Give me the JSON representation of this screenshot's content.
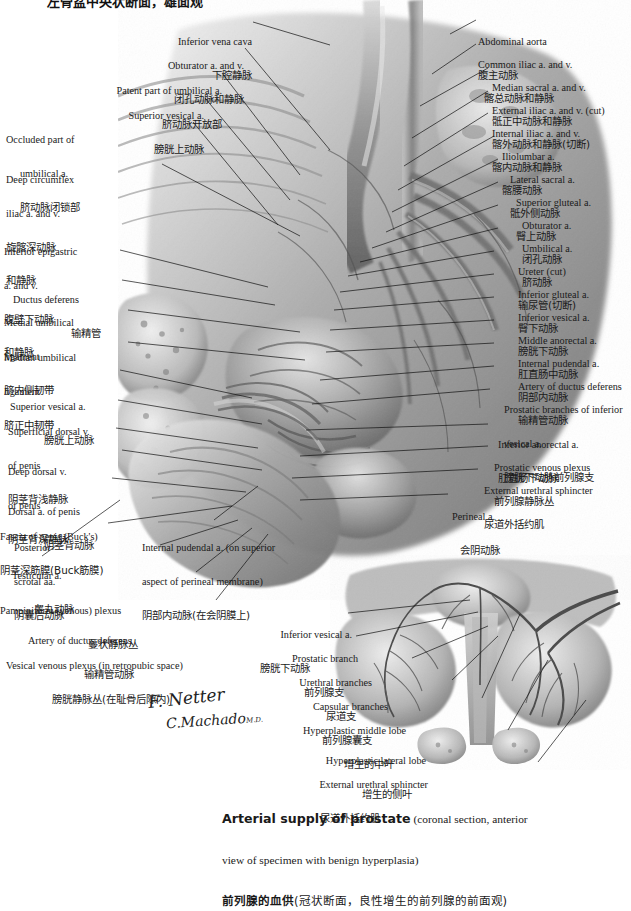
{
  "plate": {
    "top_title_clipped": "左骨盆中央状断面，雄面观",
    "caption": {
      "line1_bold": "Arterial supply of prostate",
      "line1_rest": " (coronal section, anterior",
      "line2": "view of specimen with benign hyperplasia)",
      "line3_bold_cn": "前列腺的血供",
      "line3_cn": "(冠状断面，良性增生的前列腺的前面观)"
    },
    "signatures": {
      "artist": "F. Netter",
      "coartist": "C.Machado",
      "credential": "M.D."
    },
    "colors": {
      "leader_line": "#111111",
      "text": "#1a1a1a",
      "background": "#ffffff",
      "artwork_tone": "#8c8c8c"
    }
  },
  "labels_left": [
    {
      "id": "inferior-epigastric",
      "en": [
        "Inferior epigastric",
        "a. and v."
      ],
      "cn": [
        "腹壁下动脉",
        "和静脉"
      ]
    },
    {
      "id": "ductus-deferens",
      "en": [
        "Ductus deferens"
      ],
      "cn": [
        "输精管"
      ]
    },
    {
      "id": "medial-umbilical-ligament",
      "en": [
        "Medial umbilical",
        "ligament"
      ],
      "cn": [
        "脐内侧韧带"
      ]
    },
    {
      "id": "median-umbilical-ligament",
      "en": [
        "Median umbilical",
        "ligament"
      ],
      "cn": [
        "脐正中韧带"
      ]
    },
    {
      "id": "superior-vesical-a-left",
      "en": [
        "Superior vesical a."
      ],
      "cn": [
        "膀胱上动脉"
      ]
    },
    {
      "id": "superficial-dorsal-v-penis",
      "en": [
        "Superficial dorsal v.",
        "of penis"
      ],
      "cn": [
        "阴茎背浅静脉"
      ]
    },
    {
      "id": "deep-dorsal-v-penis",
      "en": [
        "Deep dorsal v.",
        "of penis"
      ],
      "cn": [
        "阴茎背深静脉"
      ]
    },
    {
      "id": "dorsal-a-of-penis",
      "en": [
        "Dorsal a. of penis"
      ],
      "cn": [
        "阴茎背动脉"
      ]
    },
    {
      "id": "fascia-of-penis-bucks",
      "en": [
        "Fascia of penis (Buck's)"
      ],
      "cn": [
        "阴茎深筋膜(Buck筋膜)"
      ]
    },
    {
      "id": "testicular-a",
      "en": [
        "Testicular a."
      ],
      "cn": [
        "睾丸动脉"
      ]
    },
    {
      "id": "pampiniform-plexus",
      "en": [
        "Pampiniform (venous) plexus"
      ],
      "cn": [
        "蔓状静脉丛"
      ]
    },
    {
      "id": "artery-of-ductus-deferens-left",
      "en": [
        "Artery of ductus deferens"
      ],
      "cn": [
        "输精管动脉"
      ]
    },
    {
      "id": "vesical-venous-plexus",
      "en": [
        "Vesical venous plexus (in retropubic space)"
      ],
      "cn": [
        "膀胱静脉丛(在耻骨后隙内)"
      ]
    }
  ],
  "labels_upper_left": [
    {
      "id": "obturator-a-and-v",
      "en": [
        "Obturator a. and v."
      ],
      "cn": [
        "闭孔动脉和静脉"
      ]
    },
    {
      "id": "patent-part-umbilical-a",
      "en": [
        "Patent part of umbilical a."
      ],
      "cn": [
        "脐动脉开放部"
      ]
    },
    {
      "id": "superior-vesical-a-upper",
      "en": [
        "Superior vesical a."
      ],
      "cn": [
        "膀胱上动脉"
      ]
    },
    {
      "id": "occluded-part-umbilical-a",
      "en": [
        "Occluded part of",
        "umbilical a."
      ],
      "cn": [
        "脐动脉闭锁部"
      ]
    },
    {
      "id": "deep-circumflex-iliac",
      "en": [
        "Deep circumflex",
        "iliac a. and v."
      ],
      "cn": [
        "旋髂深动脉",
        "和静脉"
      ]
    }
  ],
  "labels_top_center": [
    {
      "id": "inferior-vena-cava",
      "en": [
        "Inferior vena cava"
      ],
      "cn": [
        "下腔静脉"
      ]
    }
  ],
  "labels_right": [
    {
      "id": "abdominal-aorta",
      "en": [
        "Abdominal aorta"
      ],
      "cn": [
        "腹主动脉"
      ]
    },
    {
      "id": "common-iliac",
      "en": [
        "Common iliac a. and v."
      ],
      "cn": [
        "髂总动脉和静脉"
      ]
    },
    {
      "id": "median-sacral",
      "en": [
        "Median sacral a. and v."
      ],
      "cn": [
        "骶正中动脉和静脉"
      ]
    },
    {
      "id": "external-iliac",
      "en": [
        "External iliac a. and v. (cut)"
      ],
      "cn": [
        "髂外动脉和静脉(切断)"
      ],
      "italic_tail": "cut"
    },
    {
      "id": "internal-iliac",
      "en": [
        "Internal iliac a. and v."
      ],
      "cn": [
        "髂内动脉和静脉"
      ]
    },
    {
      "id": "iliolumbar-a",
      "en": [
        "Iliolumbar a."
      ],
      "cn": [
        "髂腰动脉"
      ]
    },
    {
      "id": "lateral-sacral-a",
      "en": [
        "Lateral sacral a."
      ],
      "cn": [
        "骶外侧动脉"
      ]
    },
    {
      "id": "superior-gluteal-a",
      "en": [
        "Superior gluteal a."
      ],
      "cn": [
        "臀上动脉"
      ]
    },
    {
      "id": "obturator-a",
      "en": [
        "Obturator a."
      ],
      "cn": [
        "闭孔动脉"
      ]
    },
    {
      "id": "umbilical-a",
      "en": [
        "Umbilical a."
      ],
      "cn": [
        "脐动脉"
      ]
    },
    {
      "id": "ureter-cut",
      "en": [
        "Ureter (cut)"
      ],
      "cn": [
        "输尿管(切断)"
      ],
      "italic_tail": "cut"
    },
    {
      "id": "inferior-gluteal-a",
      "en": [
        "Inferior gluteal a."
      ],
      "cn": [
        "臀下动脉"
      ]
    },
    {
      "id": "inferior-vesical-a",
      "en": [
        "Inferior vesical a."
      ],
      "cn": [
        "膀胱下动脉"
      ]
    },
    {
      "id": "middle-anorectal-a",
      "en": [
        "Middle anorectal a."
      ],
      "cn": [
        "肛直肠中动脉"
      ]
    },
    {
      "id": "internal-pudendal-a",
      "en": [
        "Internal pudendal a."
      ],
      "cn": [
        "阴部内动脉"
      ]
    },
    {
      "id": "artery-of-ductus-deferens-right",
      "en": [
        "Artery of ductus deferens"
      ],
      "cn": [
        "输精管动脉"
      ]
    },
    {
      "id": "prostatic-branches-inferior-vesical",
      "en": [
        "Prostatic branches of inferior",
        "vesical a."
      ],
      "cn": [
        "膀胱下动脉前列腺支"
      ]
    },
    {
      "id": "inferior-anorectal-a",
      "en": [
        "Inferior anorectal a."
      ],
      "cn": [
        "肛直肠下动脉"
      ]
    },
    {
      "id": "prostatic-venous-plexus",
      "en": [
        "Prostatic venous plexus"
      ],
      "cn": [
        "前列腺静脉丛"
      ]
    },
    {
      "id": "external-urethral-sphincter-main",
      "en": [
        "External urethral sphincter"
      ],
      "cn": [
        "尿道外括约肌"
      ]
    },
    {
      "id": "perineal-a",
      "en": [
        "Perineal a."
      ],
      "cn": [
        "会阴动脉"
      ]
    }
  ],
  "labels_bottom_center": [
    {
      "id": "posterior-scrotal-aa",
      "en": [
        "Posterior",
        "scrotal aa."
      ],
      "cn": [
        "阴囊后动脉"
      ]
    },
    {
      "id": "internal-pudendal-a-perineal",
      "en": [
        "Internal pudendal a. (on superior",
        "aspect of perineal membrane)"
      ],
      "cn": [
        "阴部内动脉(在会阴膜上)"
      ]
    }
  ],
  "labels_inset": [
    {
      "id": "inset-inferior-vesical-a",
      "en": [
        "Inferior vesical a."
      ],
      "cn": [
        "膀胱下动脉"
      ]
    },
    {
      "id": "inset-prostatic-branch",
      "en": [
        "Prostatic branch"
      ],
      "cn": [
        "前列腺支"
      ]
    },
    {
      "id": "inset-urethral-branches",
      "en": [
        "Urethral branches"
      ],
      "cn": [
        "尿道支"
      ]
    },
    {
      "id": "inset-capsular-branches",
      "en": [
        "Capsular branches"
      ],
      "cn": [
        "前列腺囊支"
      ]
    },
    {
      "id": "inset-hyperplastic-middle-lobe",
      "en": [
        "Hyperplastic middle lobe"
      ],
      "cn": [
        "增生的中叶"
      ]
    },
    {
      "id": "inset-hyperplastic-lateral-lobe",
      "en": [
        "Hyperplastic lateral lobe"
      ],
      "cn": [
        "增生的侧叶"
      ]
    },
    {
      "id": "inset-external-urethral-sphincter",
      "en": [
        "External urethral sphincter"
      ],
      "cn": [
        "尿道外括约肌"
      ]
    }
  ]
}
